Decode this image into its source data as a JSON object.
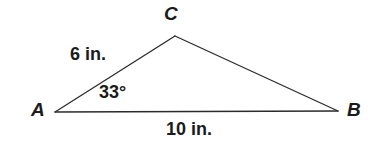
{
  "figure": {
    "kind": "triangle-diagram",
    "background_color": "#ffffff",
    "stroke_color": "#2b2b2b",
    "text_color": "#1b1b1b",
    "vertices": {
      "A": {
        "label": "A",
        "x": 55,
        "y": 112
      },
      "B": {
        "label": "B",
        "x": 338,
        "y": 111
      },
      "C": {
        "label": "C",
        "x": 175,
        "y": 36
      }
    },
    "labels": {
      "side_ac": "6 in.",
      "side_ab": "10 in.",
      "angle_a": "33°"
    }
  }
}
